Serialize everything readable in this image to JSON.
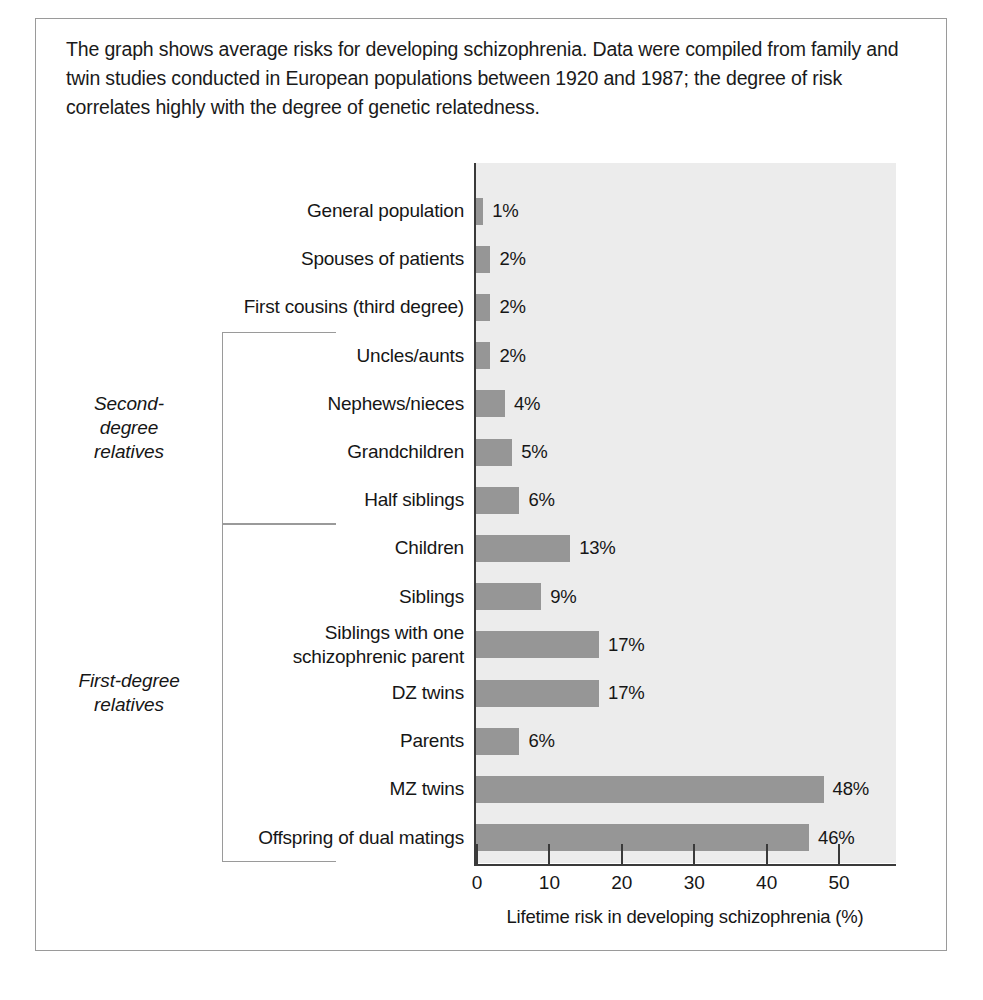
{
  "caption": "The graph shows average risks for developing schizophrenia. Data were compiled from family and twin studies conducted in European populations between 1920 and 1987; the degree of risk correlates highly with the degree of genetic relatedness.",
  "groups": [
    {
      "label": "Second-degree relatives",
      "line1": "Second-",
      "line2": "degree",
      "line3": "relatives",
      "from": 3,
      "to": 6
    },
    {
      "label": "First-degree relatives",
      "line1": "First-degree",
      "line2": "relatives",
      "line3": "",
      "from": 7,
      "to": 13
    }
  ],
  "chart_data": {
    "type": "bar",
    "orientation": "horizontal",
    "title": "",
    "subtitle": "",
    "xlabel": "Lifetime risk in developing schizophrenia (%)",
    "ylabel": "",
    "xlim": [
      0,
      58
    ],
    "xticks": [
      0,
      10,
      20,
      30,
      40,
      50
    ],
    "xtick_labels": [
      "0",
      "10",
      "20",
      "30",
      "40",
      "50"
    ],
    "grid": false,
    "legend": "none",
    "bar_color": "#969696",
    "plot_background": "#ececec",
    "axis_color": "#3a3a3a",
    "categories": [
      "General population",
      "Spouses of patients",
      "First cousins (third degree)",
      "Uncles/aunts",
      "Nephews/nieces",
      "Grandchildren",
      "Half siblings",
      "Children",
      "Siblings",
      "Siblings with one schizophrenic parent",
      "DZ twins",
      "Parents",
      "MZ twins",
      "Offspring of dual matings"
    ],
    "category_lines": [
      [
        "General population"
      ],
      [
        "Spouses of patients"
      ],
      [
        "First cousins (third degree)"
      ],
      [
        "Uncles/aunts"
      ],
      [
        "Nephews/nieces"
      ],
      [
        "Grandchildren"
      ],
      [
        "Half siblings"
      ],
      [
        "Children"
      ],
      [
        "Siblings"
      ],
      [
        "Siblings with one",
        "schizophrenic parent"
      ],
      [
        "DZ twins"
      ],
      [
        "Parents"
      ],
      [
        "MZ twins"
      ],
      [
        "Offspring of dual matings"
      ]
    ],
    "values": [
      1,
      2,
      2,
      2,
      4,
      5,
      6,
      13,
      9,
      17,
      17,
      6,
      48,
      46
    ],
    "value_labels": [
      "1%",
      "2%",
      "2%",
      "2%",
      "4%",
      "5%",
      "6%",
      "13%",
      "9%",
      "17%",
      "17%",
      "6%",
      "48%",
      "46%"
    ]
  }
}
